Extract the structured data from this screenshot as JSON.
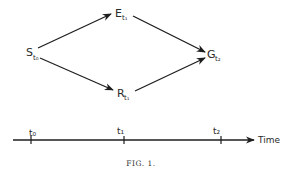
{
  "diagram": {
    "nodes": [
      {
        "id": "S",
        "label": "S",
        "subscript": "t₀",
        "x": 26,
        "y": 56
      },
      {
        "id": "E",
        "label": "E",
        "subscript": "t₁",
        "x": 115,
        "y": 17
      },
      {
        "id": "R",
        "label": "R",
        "subscript": "t₁",
        "x": 117,
        "y": 97
      },
      {
        "id": "G",
        "label": "G",
        "subscript": "t₂",
        "x": 207,
        "y": 58
      }
    ],
    "edges": [
      {
        "from": "S",
        "to": "E"
      },
      {
        "from": "S",
        "to": "R"
      },
      {
        "from": "E",
        "to": "G"
      },
      {
        "from": "R",
        "to": "G"
      }
    ],
    "timeline": {
      "axis_label": "Time",
      "ticks": [
        {
          "label": "t₀",
          "x": 31
        },
        {
          "label": "t₁",
          "x": 124
        },
        {
          "label": "t₂",
          "x": 221
        }
      ]
    },
    "caption": "FIG. 1."
  },
  "colors": {
    "ink": "#1e1e1e",
    "background": "#ffffff"
  }
}
